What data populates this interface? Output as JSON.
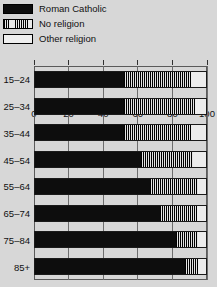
{
  "legend": {
    "position": "top-left",
    "items": [
      {
        "label": "Roman Catholic",
        "swatch": "solid-black-swatch",
        "color": "#0d0d0d"
      },
      {
        "label": "No religion",
        "swatch": "hatched-swatch",
        "color": "#e3e3e3"
      },
      {
        "label": "Other religion",
        "swatch": "empty-swatch",
        "color": "#ececec"
      }
    ]
  },
  "axis": {
    "x_ticks": [
      "0",
      "20",
      "40",
      "60",
      "80",
      "100"
    ],
    "y_categories": [
      "15–24",
      "25–34",
      "35–44",
      "45–54",
      "55–64",
      "65–74",
      "75–84",
      "85+"
    ]
  },
  "chart_data": {
    "type": "bar",
    "orientation": "horizontal",
    "stacked": true,
    "title": "",
    "subtitle": "",
    "xlabel": "",
    "ylabel": "",
    "xlim": [
      0,
      100
    ],
    "grid": true,
    "legend_position": "top-left",
    "categories": [
      "15–24",
      "25–34",
      "35–44",
      "45–54",
      "55–64",
      "65–74",
      "75–84",
      "85+"
    ],
    "xticks": [
      0,
      20,
      40,
      60,
      80,
      100
    ],
    "series": [
      {
        "name": "Roman Catholic",
        "values": [
          52,
          52,
          52,
          62,
          67,
          73,
          82,
          87
        ]
      },
      {
        "name": "No religion",
        "values": [
          39,
          41,
          39,
          30,
          28,
          21,
          13,
          8
        ]
      },
      {
        "name": "Other religion",
        "values": [
          9,
          7,
          9,
          8,
          5,
          6,
          5,
          5
        ]
      }
    ]
  }
}
